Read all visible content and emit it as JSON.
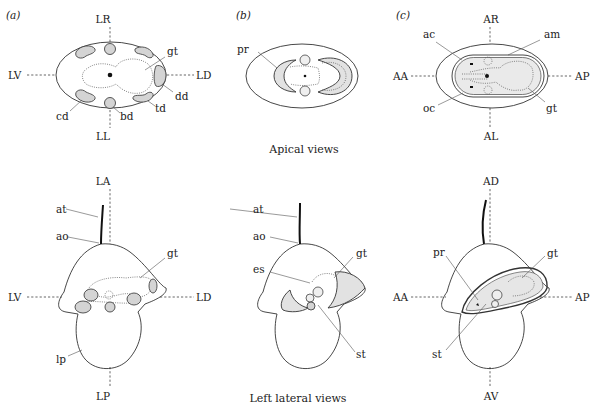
{
  "figure": {
    "captions": {
      "apical": "Apical views",
      "lateral": "Left lateral views"
    },
    "panels": [
      {
        "id": "a",
        "label": "(a)",
        "apical_axes": {
          "top": "LR",
          "bottom": "LL",
          "left": "LV",
          "right": "LD"
        },
        "apical_labels": {
          "gt": "gt",
          "dd": "dd",
          "td": "td",
          "bd": "bd",
          "cd": "cd"
        },
        "lateral_axes": {
          "top": "LA",
          "bottom": "LP",
          "left": "LV",
          "right": "LD"
        },
        "lateral_labels": {
          "at": "at",
          "ao": "ao",
          "gt": "gt",
          "lp": "lp"
        }
      },
      {
        "id": "b",
        "label": "(b)",
        "apical_labels": {
          "pr": "pr"
        },
        "lateral_labels": {
          "at": "at",
          "ao": "ao",
          "es": "es",
          "gt": "gt",
          "st": "st"
        }
      },
      {
        "id": "c",
        "label": "(c)",
        "apical_axes": {
          "top": "AR",
          "bottom": "AL",
          "left": "AA",
          "right": "AP"
        },
        "apical_labels": {
          "ac": "ac",
          "am": "am",
          "oc": "oc",
          "gt": "gt"
        },
        "lateral_axes": {
          "top": "AD",
          "bottom": "AV",
          "left": "AA",
          "right": "AP"
        },
        "lateral_labels": {
          "pr": "pr",
          "gt": "gt",
          "st": "st"
        }
      }
    ]
  }
}
